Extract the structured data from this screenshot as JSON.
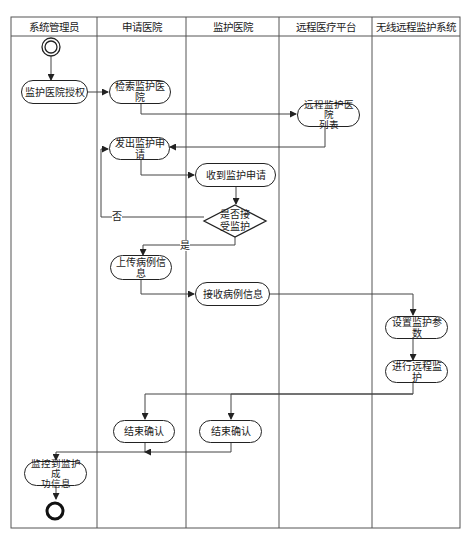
{
  "diagram": {
    "type": "UML activity (swimlane) diagram",
    "lanes": [
      {
        "id": "admin",
        "label": "系统管理员"
      },
      {
        "id": "applicant",
        "label": "申请医院"
      },
      {
        "id": "monitor",
        "label": "监护医院"
      },
      {
        "id": "platform",
        "label": "远程医疗平台"
      },
      {
        "id": "wireless",
        "label": "无线远程监护系统"
      }
    ],
    "nodes": {
      "start": {
        "type": "initial"
      },
      "authorize": {
        "label": "监护医院授权",
        "lane": "admin"
      },
      "search": {
        "label": "检索监护医院",
        "lane": "applicant"
      },
      "hospital_list": {
        "label": "远程监护医院列表",
        "line1": "远程监护医院",
        "line2": "列表",
        "lane": "platform"
      },
      "send_request": {
        "label": "发出监护申请",
        "lane": "applicant"
      },
      "receive_request": {
        "label": "收到监护申请",
        "lane": "monitor"
      },
      "decision": {
        "label": "是否接受监护",
        "line1": "是否接",
        "line2": "受监护",
        "lane": "monitor"
      },
      "upload_case": {
        "label": "上传病例信息",
        "lane": "applicant"
      },
      "receive_case": {
        "label": "接收病例信息",
        "lane": "monitor"
      },
      "set_params": {
        "label": "设置监护参数",
        "lane": "wireless"
      },
      "do_monitor": {
        "label": "进行远程监护",
        "lane": "wireless"
      },
      "confirm_applicant": {
        "label": "结束确认",
        "lane": "applicant"
      },
      "confirm_monitor": {
        "label": "结束确认",
        "lane": "monitor"
      },
      "success_info": {
        "label": "监控到监护成功信息",
        "line1": "监控到监护成",
        "line2": "功信息",
        "lane": "admin"
      },
      "end": {
        "type": "final"
      }
    },
    "guards": {
      "no": "否",
      "yes": "是"
    },
    "edges": [
      [
        "start",
        "authorize"
      ],
      [
        "authorize",
        "search"
      ],
      [
        "search",
        "hospital_list"
      ],
      [
        "hospital_list",
        "send_request"
      ],
      [
        "send_request",
        "receive_request"
      ],
      [
        "receive_request",
        "decision"
      ],
      [
        "decision",
        "send_request",
        "否"
      ],
      [
        "decision",
        "upload_case",
        "是"
      ],
      [
        "upload_case",
        "receive_case"
      ],
      [
        "receive_case",
        "set_params"
      ],
      [
        "set_params",
        "do_monitor"
      ],
      [
        "do_monitor",
        "confirm_applicant"
      ],
      [
        "do_monitor",
        "confirm_monitor"
      ],
      [
        "confirm_applicant",
        "success_info"
      ],
      [
        "confirm_monitor",
        "success_info"
      ],
      [
        "success_info",
        "end"
      ]
    ]
  }
}
